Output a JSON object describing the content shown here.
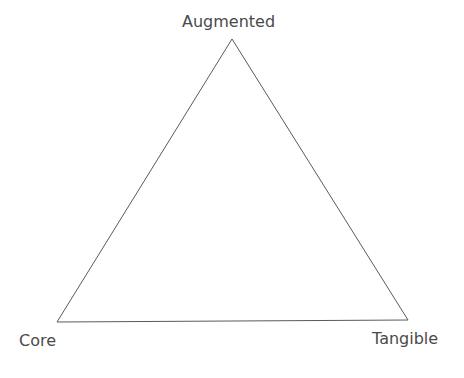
{
  "diagram": {
    "type": "triangle",
    "vertices": {
      "top": {
        "label": "Augmented"
      },
      "bottom_left": {
        "label": "Core"
      },
      "bottom_right": {
        "label": "Tangible"
      }
    },
    "line_color": "#555555"
  }
}
